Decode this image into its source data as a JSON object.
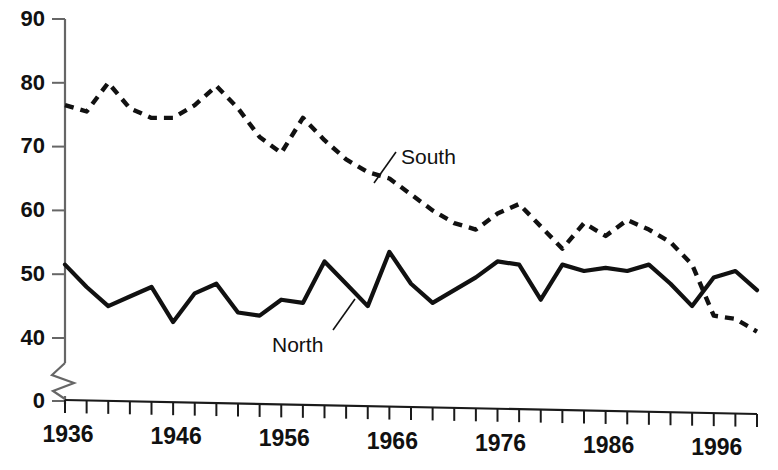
{
  "chart_data": {
    "type": "line",
    "title": "",
    "subtitle": "",
    "xlabel": "",
    "ylabel": "",
    "xlim": [
      1936,
      2000
    ],
    "ylim": [
      0,
      90
    ],
    "y_break": "axis broken between 0 and 40",
    "grid": false,
    "legend_position": "inline-annotations",
    "y_ticks": [
      0,
      40,
      50,
      60,
      70,
      80,
      90
    ],
    "y_tick_labels": [
      "0",
      "40",
      "50",
      "60",
      "70",
      "80",
      "90"
    ],
    "x_ticks": [
      1936,
      1938,
      1940,
      1942,
      1944,
      1946,
      1948,
      1950,
      1952,
      1954,
      1956,
      1958,
      1960,
      1962,
      1964,
      1966,
      1968,
      1970,
      1972,
      1974,
      1976,
      1978,
      1980,
      1982,
      1984,
      1986,
      1988,
      1990,
      1992,
      1994,
      1996,
      1998,
      2000
    ],
    "x_tick_labels": [
      "1936",
      "1946",
      "1956",
      "1966",
      "1976",
      "1986",
      "1996"
    ],
    "x_labeled_ticks": [
      1936,
      1946,
      1956,
      1966,
      1976,
      1986,
      1996
    ],
    "x": [
      1936,
      1938,
      1940,
      1942,
      1944,
      1946,
      1948,
      1950,
      1952,
      1954,
      1956,
      1958,
      1960,
      1962,
      1964,
      1966,
      1968,
      1970,
      1972,
      1974,
      1976,
      1978,
      1980,
      1982,
      1984,
      1986,
      1988,
      1990,
      1992,
      1994,
      1996,
      1998,
      2000
    ],
    "series": [
      {
        "name": "South",
        "style": "dashed",
        "color": "#111111",
        "values": [
          76.5,
          75.5,
          80.0,
          76.0,
          74.5,
          74.5,
          76.5,
          79.5,
          76.0,
          71.5,
          69.0,
          74.5,
          71.0,
          68.0,
          66.0,
          65.0,
          62.5,
          60.0,
          58.0,
          57.0,
          59.5,
          61.0,
          57.5,
          54.0,
          58.0,
          56.0,
          58.5,
          57.0,
          55.0,
          51.5,
          43.5,
          43.0,
          41.0
        ]
      },
      {
        "name": "North",
        "style": "solid",
        "color": "#111111",
        "values": [
          51.5,
          48.0,
          45.0,
          46.5,
          48.0,
          42.5,
          47.0,
          48.5,
          44.0,
          43.5,
          46.0,
          45.5,
          52.0,
          48.5,
          45.0,
          53.5,
          48.5,
          45.5,
          47.5,
          49.5,
          52.0,
          51.5,
          46.0,
          51.5,
          50.5,
          51.0,
          50.5,
          51.5,
          48.5,
          45.0,
          49.5,
          50.5,
          47.5
        ]
      }
    ],
    "annotations": [
      {
        "text": "South",
        "target_series": "South",
        "x": 1962,
        "y": 66.0
      },
      {
        "text": "North",
        "target_series": "North",
        "x": 1963,
        "y": 45.0
      }
    ]
  }
}
